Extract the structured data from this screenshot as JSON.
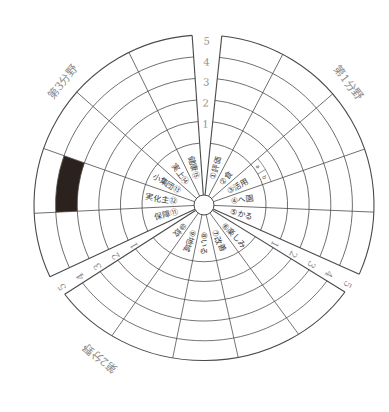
{
  "diagram": {
    "sectors": [
      {
        "title": "第1分野",
        "items": [
          {
            "no": "①",
            "name": "評価"
          },
          {
            "no": "②",
            "name": "食"
          },
          {
            "no": "③",
            "name": "活用"
          },
          {
            "no": "④",
            "name": "へ園"
          },
          {
            "no": "⑤",
            "name": "かる"
          }
        ]
      },
      {
        "title": "第2分野",
        "items": [
          {
            "no": "⑥",
            "name": "楽しみ"
          },
          {
            "no": "⑦",
            "name": "改善"
          },
          {
            "no": "⑧",
            "name": "いる"
          },
          {
            "no": "⑨",
            "name": "地域"
          },
          {
            "no": "⑩",
            "name": "紋"
          }
        ]
      },
      {
        "title": "第3分野",
        "items": [
          {
            "no": "⑪",
            "name": "保障"
          },
          {
            "no": "⑫",
            "name": "実化主"
          },
          {
            "no": "⑬",
            "name": "小集団"
          },
          {
            "no": "⑭",
            "name": "実上"
          },
          {
            "no": "⑮",
            "name": "健康"
          }
        ]
      }
    ],
    "scale": [
      "1",
      "2",
      "3",
      "4",
      "5"
    ],
    "sub_cells": {
      "sector": 1,
      "item": "③",
      "labels": [
        "a",
        "b"
      ]
    },
    "filled_cells": [
      {
        "sector": 3,
        "item": "⑫",
        "level": 4,
        "color": "#2b211d"
      }
    ]
  },
  "colors": {
    "line": "#4a4a4a",
    "background": "#ffffff",
    "label_text": "#3d3d3d",
    "scale_text": "#8f8f8f",
    "title_text": "#8a8a8a",
    "fill": "#2b211d"
  }
}
